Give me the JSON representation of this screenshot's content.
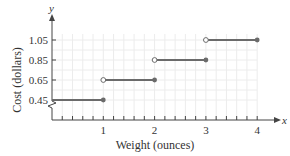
{
  "chart_data": {
    "type": "line",
    "subtype": "step",
    "title": "",
    "xlabel": "Weight (ounces)",
    "ylabel": "Cost (dollars)",
    "x_axis_var": "x",
    "y_axis_var": "y",
    "xlim": [
      0,
      4
    ],
    "ylim": [
      0.45,
      1.05
    ],
    "x_ticks": [
      "1",
      "2",
      "3",
      "4"
    ],
    "y_ticks": [
      "0.45",
      "0.65",
      "0.85",
      "1.05"
    ],
    "grid": true,
    "y_axis_break": true,
    "segments": [
      {
        "x_start": 0,
        "x_end": 1,
        "y": 0.45,
        "start_open": false,
        "end_closed": true
      },
      {
        "x_start": 1,
        "x_end": 2,
        "y": 0.65,
        "start_open": true,
        "end_closed": true
      },
      {
        "x_start": 2,
        "x_end": 3,
        "y": 0.85,
        "start_open": true,
        "end_closed": true
      },
      {
        "x_start": 3,
        "x_end": 4,
        "y": 1.05,
        "start_open": true,
        "end_closed": true
      }
    ],
    "colors": {
      "line": "#6b6b6b",
      "grid": "#ececec",
      "axis": "#444444"
    }
  }
}
